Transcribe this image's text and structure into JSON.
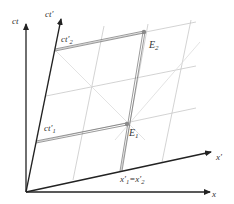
{
  "diagram": {
    "colors": {
      "axis": "#222222",
      "grid": "#c8c8c8",
      "light_cone": "#dcdcdc",
      "event": "#8a8a8a",
      "projection": "#555555",
      "label": "#333333"
    },
    "axes": {
      "ct": {
        "label": "ct"
      },
      "ct_prime": {
        "label": "ct′"
      },
      "x": {
        "label": "x"
      },
      "x_prime": {
        "label": "x′"
      }
    },
    "events": [
      {
        "id": "E2",
        "label": "E",
        "sub": "2"
      },
      {
        "id": "E1",
        "label": "E",
        "sub": "1"
      }
    ],
    "projections": {
      "ct2": {
        "label": "ct′",
        "sub": "2"
      },
      "ct1": {
        "label": "ct′",
        "sub": "1"
      },
      "x12": {
        "label_a": "x′",
        "sub_a": "1",
        "eq": "=",
        "label_b": "x′",
        "sub_b": "2"
      }
    }
  }
}
